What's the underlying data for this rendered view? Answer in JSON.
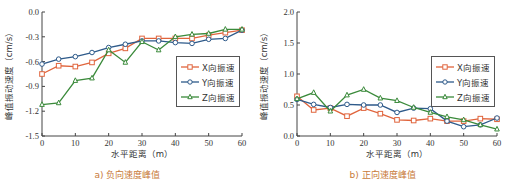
{
  "chart_data": [
    {
      "type": "line",
      "title": "",
      "caption": "a) 负向速度峰值",
      "xlabel": "水平距离（m）",
      "ylabel": "峰值振动速度（cm/s）",
      "x": [
        0,
        5,
        10,
        15,
        20,
        25,
        30,
        35,
        40,
        45,
        50,
        55,
        60
      ],
      "xlim": [
        0,
        60
      ],
      "ylim": [
        -1.5,
        0.0
      ],
      "xticks": [
        "0",
        "10",
        "20",
        "30",
        "40",
        "50",
        "60"
      ],
      "yticks": [
        "0.0",
        "-0.3",
        "-0.6",
        "-0.9",
        "-1.2",
        "-1.5"
      ],
      "grid": false,
      "legend_position": "right-middle",
      "series": [
        {
          "name": "X向振速",
          "color": "#e0643c",
          "marker": "square",
          "values": [
            -0.75,
            -0.65,
            -0.66,
            -0.61,
            -0.5,
            -0.44,
            -0.32,
            -0.32,
            -0.32,
            -0.32,
            -0.28,
            -0.25,
            -0.22
          ]
        },
        {
          "name": "Y向振速",
          "color": "#2e5a8a",
          "marker": "circle",
          "values": [
            -0.63,
            -0.57,
            -0.54,
            -0.49,
            -0.43,
            -0.39,
            -0.35,
            -0.35,
            -0.37,
            -0.38,
            -0.33,
            -0.32,
            -0.22
          ]
        },
        {
          "name": "Z向振速",
          "color": "#3a8a3a",
          "marker": "triangle",
          "values": [
            -1.12,
            -1.1,
            -0.83,
            -0.8,
            -0.46,
            -0.61,
            -0.36,
            -0.46,
            -0.3,
            -0.27,
            -0.26,
            -0.21,
            -0.21
          ]
        }
      ]
    },
    {
      "type": "line",
      "title": "",
      "caption": "b) 正向速度峰值",
      "xlabel": "水平距离（m）",
      "ylabel": "峰值振动速度（cm/s）",
      "x": [
        0,
        5,
        10,
        15,
        20,
        25,
        30,
        35,
        40,
        45,
        50,
        55,
        60
      ],
      "xlim": [
        0,
        60
      ],
      "ylim": [
        0.0,
        2.0
      ],
      "xticks": [
        "0",
        "10",
        "20",
        "30",
        "40",
        "50",
        "60"
      ],
      "yticks": [
        "2.0",
        "1.5",
        "1.0",
        "0.5",
        "0.0"
      ],
      "grid": false,
      "legend_position": "right-middle",
      "series": [
        {
          "name": "X向振速",
          "color": "#e0643c",
          "marker": "square",
          "values": [
            0.64,
            0.42,
            0.45,
            0.32,
            0.45,
            0.36,
            0.26,
            0.25,
            0.28,
            0.24,
            0.24,
            0.28,
            0.27
          ]
        },
        {
          "name": "Y向振速",
          "color": "#2e5a8a",
          "marker": "circle",
          "values": [
            0.59,
            0.51,
            0.46,
            0.51,
            0.5,
            0.5,
            0.38,
            0.45,
            0.44,
            0.24,
            0.15,
            0.18,
            0.29
          ]
        },
        {
          "name": "Z向振速",
          "color": "#3a8a3a",
          "marker": "triangle",
          "values": [
            0.6,
            0.7,
            0.4,
            0.66,
            0.75,
            0.61,
            0.57,
            0.46,
            0.38,
            0.31,
            0.26,
            0.18,
            0.11
          ]
        }
      ]
    }
  ]
}
